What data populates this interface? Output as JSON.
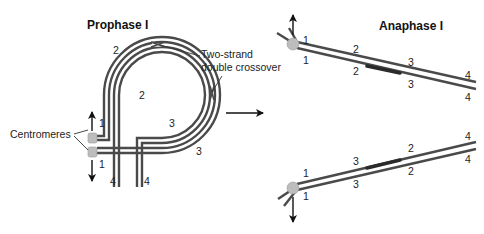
{
  "titles": {
    "prophase": "Prophase I",
    "anaphase": "Anaphase I"
  },
  "labels": {
    "crossover_line1": "Two-strand",
    "crossover_line2": "double crossover",
    "centromeres": "Centromeres"
  },
  "prophase_numbers": {
    "n1_top": "1",
    "n1_bottom": "1",
    "n2_outer": "2",
    "n2_inner": "2",
    "n3_inner": "3",
    "n3_outer": "3",
    "n4_left": "4",
    "n4_right": "4"
  },
  "anaphase_top_numbers": {
    "upper": [
      "1",
      "2",
      "3",
      "4"
    ],
    "lower": [
      "1",
      "2",
      "3",
      "4"
    ]
  },
  "anaphase_bottom_numbers": {
    "upper": [
      "1",
      "3",
      "2",
      "4"
    ],
    "lower": [
      "1",
      "3",
      "2",
      "4"
    ]
  },
  "colors": {
    "strand": "#4a4a4a",
    "centromere": "#bdbdbd",
    "background": "#ffffff"
  }
}
